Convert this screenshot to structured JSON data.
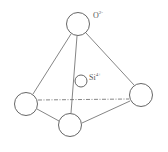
{
  "diagram": {
    "labels": {
      "oxygen_base": "O",
      "oxygen_charge": "2-",
      "silicon_base": "Si",
      "silicon_charge": "4+"
    },
    "nodes": [
      {
        "id": "O-top",
        "cx": 78,
        "cy": 24,
        "r": 11.5
      },
      {
        "id": "O-left",
        "cx": 26,
        "cy": 104,
        "r": 11.5
      },
      {
        "id": "O-right",
        "cx": 141,
        "cy": 95,
        "r": 11.5
      },
      {
        "id": "O-front",
        "cx": 70,
        "cy": 125,
        "r": 11.5
      },
      {
        "id": "Si-center",
        "cx": 81,
        "cy": 81,
        "r": 6
      }
    ],
    "colors": {
      "stroke": "#555555",
      "background": "#ffffff"
    }
  }
}
